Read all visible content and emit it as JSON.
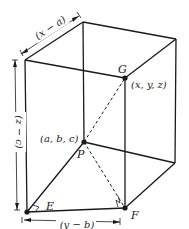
{
  "figure": {
    "type": "3d-box-distance-diagram",
    "colors": {
      "ink": "#1a1a1a",
      "background": "#ffffff"
    },
    "points": {
      "G": {
        "label": "G",
        "coords": "(x, y, z)"
      },
      "P": {
        "label": "P",
        "coords": "(a, b, c)"
      },
      "E": {
        "label": "E"
      },
      "F": {
        "label": "F"
      }
    },
    "dimensions": {
      "top": "(x − a)",
      "left": "(z − c)",
      "bottom": "(y − b)"
    }
  }
}
